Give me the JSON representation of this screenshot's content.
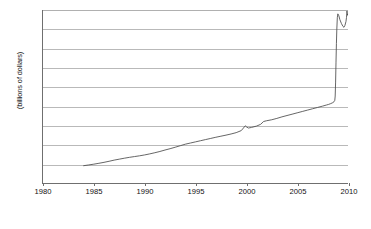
{
  "chart_data": {
    "type": "line",
    "title": "",
    "subtitle": "",
    "xlabel": "",
    "ylabel": "(billions of dollars)",
    "xlim": [
      1980,
      2010
    ],
    "ylim": [
      0,
      1800
    ],
    "ytick_labels": [
      "1,800",
      "1,600",
      "1,400",
      "1,200",
      "1,000",
      "800",
      "600",
      "400",
      "200",
      "0"
    ],
    "ytick_values": [
      1800,
      1600,
      1400,
      1200,
      1000,
      800,
      600,
      400,
      200,
      0
    ],
    "xtick_labels": [
      "1980",
      "1985",
      "1990",
      "1995",
      "2000",
      "2005",
      "2010"
    ],
    "xtick_values": [
      1980,
      1985,
      1990,
      1995,
      2000,
      2005,
      2010
    ],
    "grid": "horizontal",
    "legend": "none",
    "series": [
      {
        "name": "Total",
        "color": "#4a4a4a",
        "x": [
          1984.0,
          1984.5,
          1985.0,
          1985.5,
          1986.0,
          1986.5,
          1987.0,
          1987.5,
          1988.0,
          1988.5,
          1989.0,
          1989.5,
          1990.0,
          1990.5,
          1991.0,
          1991.5,
          1992.0,
          1992.5,
          1993.0,
          1993.5,
          1994.0,
          1994.5,
          1995.0,
          1995.5,
          1996.0,
          1996.5,
          1997.0,
          1997.5,
          1998.0,
          1998.5,
          1999.0,
          1999.5,
          1999.9,
          2000.0,
          2000.2,
          2000.5,
          2001.0,
          2001.4,
          2001.7,
          2002.0,
          2002.5,
          2003.0,
          2003.5,
          2004.0,
          2004.5,
          2005.0,
          2005.5,
          2006.0,
          2006.5,
          2007.0,
          2007.5,
          2007.9,
          2008.1,
          2008.3,
          2008.5,
          2008.62,
          2008.7,
          2008.74,
          2008.78,
          2008.82,
          2008.86,
          2008.9,
          2008.95,
          2009.0,
          2009.1,
          2009.2,
          2009.35,
          2009.5,
          2009.6,
          2009.7,
          2009.8,
          2009.85,
          2009.88,
          2009.9,
          2009.92,
          2009.94,
          2009.95
        ],
        "y": [
          180,
          188,
          196,
          205,
          215,
          226,
          238,
          248,
          258,
          267,
          275,
          283,
          292,
          303,
          315,
          328,
          343,
          357,
          372,
          388,
          404,
          416,
          428,
          440,
          452,
          464,
          476,
          487,
          498,
          510,
          524,
          545,
          595,
          585,
          572,
          578,
          592,
          610,
          640,
          648,
          658,
          672,
          688,
          702,
          716,
          730,
          744,
          758,
          772,
          786,
          800,
          812,
          818,
          826,
          836,
          845,
          860,
          905,
          1050,
          1250,
          1450,
          1600,
          1720,
          1760,
          1740,
          1700,
          1660,
          1630,
          1620,
          1640,
          1680,
          1720,
          1760,
          1790,
          1770,
          1745,
          1755
        ]
      }
    ],
    "annotations": [
      {
        "text": "sharp vertical spike in late 2008",
        "x": 2008.8,
        "y": 1750
      }
    ]
  }
}
